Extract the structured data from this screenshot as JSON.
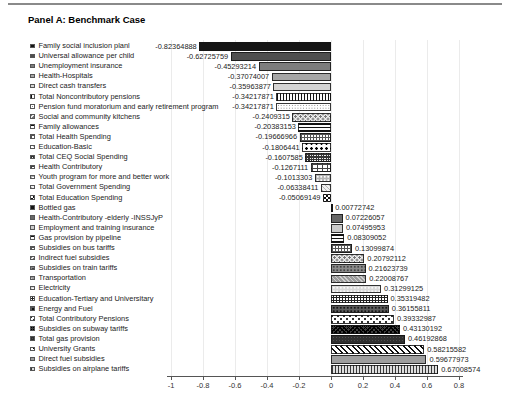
{
  "page": {
    "title": "Panel A: Benchmark Case"
  },
  "chart_data": {
    "type": "bar",
    "orientation": "horizontal",
    "title": "Panel A: Benchmark Case",
    "xlabel": "",
    "ylabel": "",
    "xlim": [
      -1,
      0.8
    ],
    "x_tick_labels": [
      "-1",
      "-0.8",
      "-0.6",
      "-0.4",
      "-0.2",
      "0",
      "0.2",
      "0.4",
      "0.6",
      "0.8"
    ],
    "grid": true,
    "legend_position": "left",
    "items": [
      {
        "label": "Family social inclusion planl",
        "value": -0.82364888,
        "value_label": "-0.82364888",
        "pattern": "s1"
      },
      {
        "label": "Universal allowance per child",
        "value": -0.62725759,
        "value_label": "-0.62725759",
        "pattern": "s2"
      },
      {
        "label": "Unemployment insurance",
        "value": -0.45293214,
        "value_label": "-0.45293214",
        "pattern": "s3"
      },
      {
        "label": "Health-Hospitals",
        "value": -0.37074007,
        "value_label": "-0.37074007",
        "pattern": "s4"
      },
      {
        "label": "Direct cash transfers",
        "value": -0.35963877,
        "value_label": "-0.35963877",
        "pattern": "s5"
      },
      {
        "label": "Total Noncontributory pensions",
        "value": -0.34217871,
        "value_label": "-0.34217871",
        "pattern": "vlines"
      },
      {
        "label": "Pension fund moratorium and early retirement program",
        "value": -0.34217871,
        "value_label": "-0.34217871",
        "pattern": "finedots"
      },
      {
        "label": "Social and community kitchens",
        "value": -0.2409315,
        "value_label": "-0.2409315",
        "pattern": "diagdots2"
      },
      {
        "label": "Family allowances",
        "value": -0.20383153,
        "value_label": "-0.20383153",
        "pattern": "hlines"
      },
      {
        "label": "Total Health Spending",
        "value": -0.19666966,
        "value_label": "-0.19666966",
        "pattern": "grid"
      },
      {
        "label": "Education-Basic",
        "value": -0.1806441,
        "value_label": "-0.1806441",
        "pattern": "plus"
      },
      {
        "label": "Total CEQ Social Spending",
        "value": -0.1607585,
        "value_label": "-0.1607585",
        "pattern": "densegrid"
      },
      {
        "label": "Health Contributory",
        "value": -0.1267111,
        "value_label": "-0.1267111",
        "pattern": "brick"
      },
      {
        "label": "Youth program for more and better work",
        "value": -0.1013303,
        "value_label": "-0.1013303",
        "pattern": "dotsgray"
      },
      {
        "label": "Total Government Spending",
        "value": -0.06338411,
        "value_label": "-0.06338411",
        "pattern": "lightdiag"
      },
      {
        "label": "Total Education Spending",
        "value": -0.05069149,
        "value_label": "-0.05069149",
        "pattern": "checker"
      },
      {
        "label": "Bottled gas",
        "value": 0.00772742,
        "value_label": "0.00772742",
        "pattern": "s1"
      },
      {
        "label": "Health-Contributory -elderly -INSSJyP",
        "value": 0.07226057,
        "value_label": "0.07226057",
        "pattern": "dkgray"
      },
      {
        "label": "Employment and training insurance",
        "value": 0.07495953,
        "value_label": "0.07495953",
        "pattern": "ltgray"
      },
      {
        "label": "Gas provision by pipeline",
        "value": 0.08309052,
        "value_label": "0.08309052",
        "pattern": "hlines"
      },
      {
        "label": "Subsidies on bus tariffs",
        "value": 0.13099874,
        "value_label": "0.13099874",
        "pattern": "grid"
      },
      {
        "label": "Indirect fuel subsidies",
        "value": 0.20792112,
        "value_label": "0.20792112",
        "pattern": "diagdots2"
      },
      {
        "label": "Subsidies on train tariffs",
        "value": 0.21623739,
        "value_label": "0.21623739",
        "pattern": "dotsdark"
      },
      {
        "label": "Transportation",
        "value": 0.22008767,
        "value_label": "0.22008767",
        "pattern": "graydiag"
      },
      {
        "label": "Electricity",
        "value": 0.31299125,
        "value_label": "0.31299125",
        "pattern": "lightdots"
      },
      {
        "label": "Education-Tertiary and Universitary",
        "value": 0.35319482,
        "value_label": "0.35319482",
        "pattern": "densedots"
      },
      {
        "label": "Energy and Fuel",
        "value": 0.36155811,
        "value_label": "0.36155811",
        "pattern": "darkdots"
      },
      {
        "label": "Total Contributory Pensions",
        "value": 0.39332987,
        "value_label": "0.39332987",
        "pattern": "xdots"
      },
      {
        "label": "Subsidies on subway tariffs",
        "value": 0.43130192,
        "value_label": "0.43130192",
        "pattern": "darkcross"
      },
      {
        "label": "Total gas provision",
        "value": 0.46192868,
        "value_label": "0.46192868",
        "pattern": "verydark"
      },
      {
        "label": "University Grants",
        "value": 0.58215582,
        "value_label": "0.58215582",
        "pattern": "diagstripes"
      },
      {
        "label": "Direct fuel subsidies",
        "value": 0.59677973,
        "value_label": "0.59677973",
        "pattern": "midgray"
      },
      {
        "label": "Subsidies on airplane tariffs",
        "value": 0.67008574,
        "value_label": "0.67008574",
        "pattern": "vlines2"
      }
    ],
    "colors": {
      "background": "#ffffff",
      "axis": "#555555",
      "gridline": "#ebebeb",
      "top_rule": "#8a8a8a",
      "text": "#222222"
    }
  }
}
